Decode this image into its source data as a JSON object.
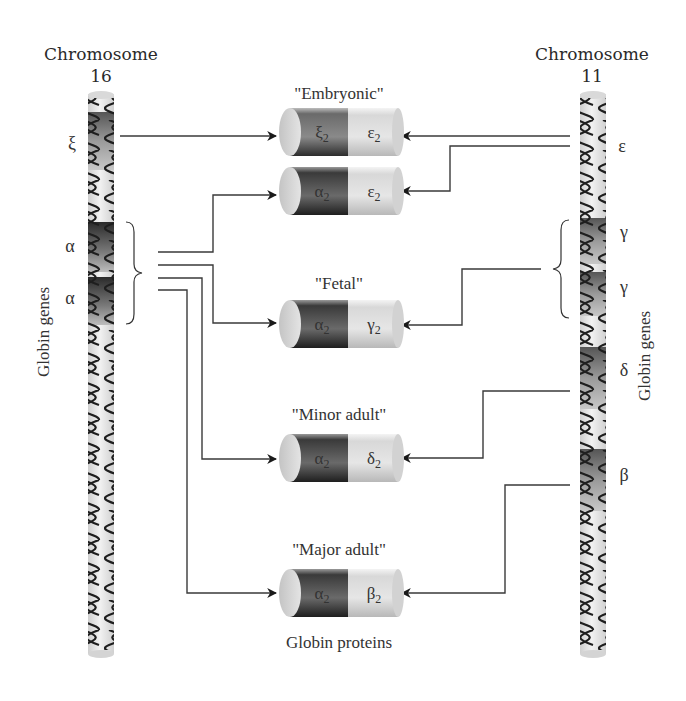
{
  "diagram": {
    "chromosome_left": {
      "title": "Chromosome",
      "number": "16",
      "side_label": "Globin genes",
      "genes": [
        {
          "symbol": "ξ",
          "name": "zeta"
        },
        {
          "symbol": "α",
          "name": "alpha-1"
        },
        {
          "symbol": "α",
          "name": "alpha-2"
        }
      ]
    },
    "chromosome_right": {
      "title": "Chromosome",
      "number": "11",
      "side_label": "Globin genes",
      "genes": [
        {
          "symbol": "ε",
          "name": "epsilon"
        },
        {
          "symbol": "γ",
          "name": "gamma-1"
        },
        {
          "symbol": "γ",
          "name": "gamma-2"
        },
        {
          "symbol": "δ",
          "name": "delta"
        },
        {
          "symbol": "β",
          "name": "beta"
        }
      ]
    },
    "proteins": [
      {
        "group_label": "\"Embryonic\"",
        "left": "ξ",
        "right": "ε",
        "sub": "2"
      },
      {
        "group_label": "",
        "left": "α",
        "right": "ε",
        "sub": "2"
      },
      {
        "group_label": "\"Fetal\"",
        "left": "α",
        "right": "γ",
        "sub": "2"
      },
      {
        "group_label": "\"Minor adult\"",
        "left": "α",
        "right": "δ",
        "sub": "2"
      },
      {
        "group_label": "\"Major adult\"",
        "left": "α",
        "right": "β",
        "sub": "2"
      }
    ],
    "bottom_label": "Globin proteins",
    "colors": {
      "dark_band": "#3c3c3c",
      "light_band": "#d6d6d6",
      "chromosome": "#e4e4e4",
      "line": "#3a3a3a"
    }
  }
}
